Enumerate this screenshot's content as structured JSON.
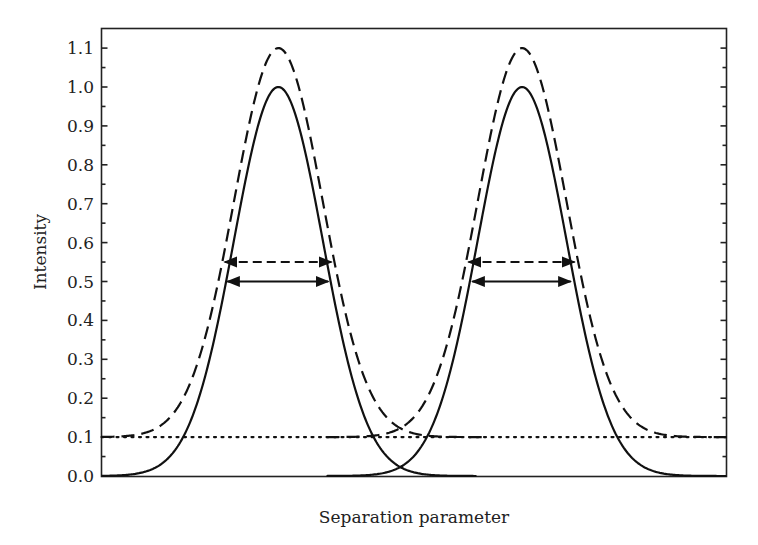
{
  "chart_data": {
    "type": "line",
    "title": "",
    "xlabel": "Separation parameter",
    "ylabel": "Intensity",
    "ylim": [
      0.0,
      1.15
    ],
    "xlim": [
      0,
      1
    ],
    "grid": false,
    "legend": null,
    "y_ticks": [
      "0.0",
      "0.1",
      "0.2",
      "0.3",
      "0.4",
      "0.5",
      "0.6",
      "0.7",
      "0.8",
      "0.9",
      "1.0",
      "1.1"
    ],
    "x_ticks": [],
    "series": [
      {
        "name": "peak-1-solid",
        "style": "solid",
        "center": 0.283,
        "sigma": 0.071,
        "amplitude": 1.0,
        "baseline": 0.0,
        "x_range": [
          0.0,
          0.6
        ]
      },
      {
        "name": "peak-2-solid",
        "style": "solid",
        "center": 0.673,
        "sigma": 0.071,
        "amplitude": 1.0,
        "baseline": 0.0,
        "x_range": [
          0.36,
          1.0
        ]
      },
      {
        "name": "peak-1-dashed",
        "style": "dashed",
        "center": 0.283,
        "sigma": 0.071,
        "amplitude": 1.0,
        "baseline": 0.1,
        "x_range": [
          0.0,
          0.61
        ]
      },
      {
        "name": "peak-2-dashed",
        "style": "dashed",
        "center": 0.673,
        "sigma": 0.071,
        "amplitude": 1.0,
        "baseline": 0.1,
        "x_range": [
          0.36,
          1.0
        ]
      },
      {
        "name": "background-level",
        "style": "dotted",
        "constant": 0.1,
        "x_range": [
          0.0,
          1.0
        ]
      }
    ],
    "annotations": [
      {
        "type": "double-arrow",
        "style": "dashed",
        "y": 0.55,
        "x_from": 0.194,
        "x_to": 0.371,
        "label": "FWHM (with background)"
      },
      {
        "type": "double-arrow",
        "style": "solid",
        "y": 0.5,
        "x_from": 0.198,
        "x_to": 0.366,
        "label": "FWHM"
      },
      {
        "type": "double-arrow",
        "style": "dashed",
        "y": 0.55,
        "x_from": 0.584,
        "x_to": 0.76,
        "label": "FWHM (with background)"
      },
      {
        "type": "double-arrow",
        "style": "solid",
        "y": 0.5,
        "x_from": 0.59,
        "x_to": 0.754,
        "label": "FWHM"
      }
    ]
  }
}
